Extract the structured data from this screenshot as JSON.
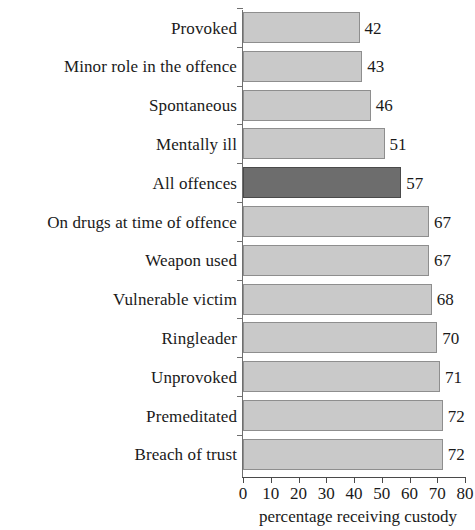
{
  "chart_data": {
    "type": "bar",
    "orientation": "horizontal",
    "title": "",
    "subtitle": "",
    "xlabel": "percentage receiving custody",
    "ylabel": "",
    "xlim": [
      0,
      80
    ],
    "xticks": [
      0,
      10,
      20,
      30,
      40,
      50,
      60,
      70,
      80
    ],
    "xtick_labels": [
      "0",
      "10",
      "20",
      "30",
      "40",
      "50",
      "60",
      "70",
      "80"
    ],
    "grid": false,
    "legend": null,
    "categories": [
      "Provoked",
      "Minor role in the offence",
      "Spontaneous",
      "Mentally ill",
      "All offences",
      "On drugs at time of offence",
      "Weapon used",
      "Vulnerable victim",
      "Ringleader",
      "Unprovoked",
      "Premeditated",
      "Breach of trust"
    ],
    "values": [
      42,
      43,
      46,
      51,
      57,
      67,
      67,
      68,
      70,
      71,
      72,
      72
    ],
    "value_labels": [
      "42",
      "43",
      "46",
      "51",
      "57",
      "67",
      "67",
      "68",
      "70",
      "71",
      "72",
      "72"
    ],
    "highlight_index": 4,
    "colors": {
      "bar": "#c9c9c9",
      "bar_border": "#8e8e8e",
      "highlight_bar": "#6d6d6d",
      "highlight_bar_border": "#4a4a4a",
      "axis": "#4a4a4a",
      "text": "#1a1a1a",
      "background": "#ffffff"
    }
  }
}
